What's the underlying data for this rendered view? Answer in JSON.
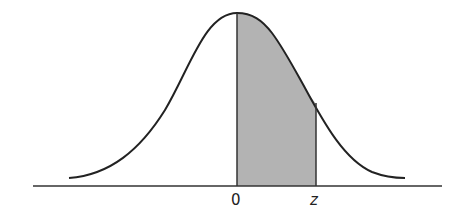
{
  "figure": {
    "type": "normal-distribution-shaded-area",
    "labels": {
      "mean": "0",
      "z": "z"
    },
    "shaded_region": {
      "from": "0",
      "to": "z"
    },
    "colors": {
      "curve": "#222222",
      "axis": "#333333",
      "fill": "#b3b3b3",
      "background": "#ffffff"
    }
  }
}
